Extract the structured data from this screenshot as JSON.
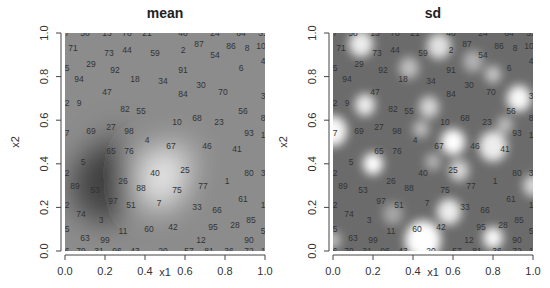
{
  "chart_data": [
    {
      "type": "heatmap",
      "title": "mean",
      "xlabel": "x1",
      "ylabel": "x2",
      "xlim": [
        0,
        1
      ],
      "ylim": [
        0,
        1
      ],
      "xticks": [
        "0.0",
        "0.2",
        "0.4",
        "0.6",
        "0.8",
        "1.0"
      ],
      "yticks": [
        "0.0",
        "0.2",
        "0.4",
        "0.6",
        "0.8",
        "1.0"
      ],
      "colormap": "grayscale",
      "base_value": 0.55,
      "features": [
        {
          "kind": "bright",
          "x": 0.47,
          "y": 0.33,
          "radius": 0.14,
          "strength": 0.45
        },
        {
          "kind": "bright",
          "x": 0.56,
          "y": 0.42,
          "radius": 0.1,
          "strength": 0.2
        },
        {
          "kind": "dark",
          "x": 0.2,
          "y": 0.3,
          "radius": 0.17,
          "strength": 0.32
        },
        {
          "kind": "dark",
          "x": 0.25,
          "y": 0.45,
          "radius": 0.12,
          "strength": 0.12
        }
      ],
      "points": [
        {
          "label": "7",
          "x": 0.01,
          "y": 1.0
        },
        {
          "label": "58",
          "x": 0.1,
          "y": 1.0
        },
        {
          "label": "13",
          "x": 0.21,
          "y": 1.0
        },
        {
          "label": "78",
          "x": 0.31,
          "y": 1.0
        },
        {
          "label": "21",
          "x": 0.41,
          "y": 1.0
        },
        {
          "label": "48",
          "x": 0.59,
          "y": 1.0
        },
        {
          "label": "24",
          "x": 0.75,
          "y": 1.0
        },
        {
          "label": "64",
          "x": 0.88,
          "y": 1.0
        },
        {
          "label": "31",
          "x": 0.99,
          "y": 1.0
        },
        {
          "label": "71",
          "x": 0.04,
          "y": 0.93
        },
        {
          "label": "73",
          "x": 0.22,
          "y": 0.91
        },
        {
          "label": "44",
          "x": 0.31,
          "y": 0.92
        },
        {
          "label": "59",
          "x": 0.45,
          "y": 0.91
        },
        {
          "label": "2",
          "x": 0.59,
          "y": 0.92
        },
        {
          "label": "87",
          "x": 0.67,
          "y": 0.95
        },
        {
          "label": "54",
          "x": 0.75,
          "y": 0.9
        },
        {
          "label": "86",
          "x": 0.83,
          "y": 0.94
        },
        {
          "label": "8",
          "x": 0.91,
          "y": 0.93
        },
        {
          "label": "10",
          "x": 0.98,
          "y": 0.94
        },
        {
          "label": "5",
          "x": 0.01,
          "y": 0.84
        },
        {
          "label": "29",
          "x": 0.13,
          "y": 0.86
        },
        {
          "label": "92",
          "x": 0.25,
          "y": 0.83
        },
        {
          "label": "18",
          "x": 0.35,
          "y": 0.79
        },
        {
          "label": "91",
          "x": 0.59,
          "y": 0.83
        },
        {
          "label": "6",
          "x": 0.88,
          "y": 0.84
        },
        {
          "label": "4",
          "x": 0.99,
          "y": 0.87
        },
        {
          "label": "94",
          "x": 0.07,
          "y": 0.79
        },
        {
          "label": "34",
          "x": 0.49,
          "y": 0.78
        },
        {
          "label": "30",
          "x": 0.68,
          "y": 0.76
        },
        {
          "label": "47",
          "x": 0.21,
          "y": 0.73
        },
        {
          "label": "84",
          "x": 0.59,
          "y": 0.72
        },
        {
          "label": "70",
          "x": 0.79,
          "y": 0.73
        },
        {
          "label": "3",
          "x": 0.99,
          "y": 0.71
        },
        {
          "label": "2",
          "x": 0.01,
          "y": 0.68
        },
        {
          "label": "9",
          "x": 0.07,
          "y": 0.68
        },
        {
          "label": "82",
          "x": 0.3,
          "y": 0.65
        },
        {
          "label": "55",
          "x": 0.38,
          "y": 0.64
        },
        {
          "label": "56",
          "x": 0.89,
          "y": 0.64
        },
        {
          "label": "8",
          "x": 0.99,
          "y": 0.61
        },
        {
          "label": "10",
          "x": 0.56,
          "y": 0.59
        },
        {
          "label": "68",
          "x": 0.66,
          "y": 0.61
        },
        {
          "label": "23",
          "x": 0.77,
          "y": 0.59
        },
        {
          "label": "7",
          "x": 0.01,
          "y": 0.54
        },
        {
          "label": "69",
          "x": 0.13,
          "y": 0.55
        },
        {
          "label": "27",
          "x": 0.23,
          "y": 0.57
        },
        {
          "label": "98",
          "x": 0.32,
          "y": 0.55
        },
        {
          "label": "4",
          "x": 0.41,
          "y": 0.51
        },
        {
          "label": "93",
          "x": 0.92,
          "y": 0.54
        },
        {
          "label": "1",
          "x": 0.99,
          "y": 0.53
        },
        {
          "label": "65",
          "x": 0.23,
          "y": 0.46
        },
        {
          "label": "76",
          "x": 0.32,
          "y": 0.46
        },
        {
          "label": "67",
          "x": 0.53,
          "y": 0.48
        },
        {
          "label": "46",
          "x": 0.71,
          "y": 0.48
        },
        {
          "label": "41",
          "x": 0.86,
          "y": 0.47
        },
        {
          "label": "5",
          "x": 0.09,
          "y": 0.41
        },
        {
          "label": "2",
          "x": 0.01,
          "y": 0.36
        },
        {
          "label": "40",
          "x": 0.45,
          "y": 0.36
        },
        {
          "label": "25",
          "x": 0.6,
          "y": 0.37
        },
        {
          "label": "80",
          "x": 0.92,
          "y": 0.36
        },
        {
          "label": "3",
          "x": 0.99,
          "y": 0.36
        },
        {
          "label": "89",
          "x": 0.05,
          "y": 0.3
        },
        {
          "label": "26",
          "x": 0.29,
          "y": 0.32
        },
        {
          "label": "88",
          "x": 0.38,
          "y": 0.29
        },
        {
          "label": "75",
          "x": 0.56,
          "y": 0.28
        },
        {
          "label": "77",
          "x": 0.69,
          "y": 0.3
        },
        {
          "label": "1",
          "x": 0.81,
          "y": 0.32
        },
        {
          "label": "53",
          "x": 0.15,
          "y": 0.28
        },
        {
          "label": "97",
          "x": 0.24,
          "y": 0.23
        },
        {
          "label": "51",
          "x": 0.33,
          "y": 0.21
        },
        {
          "label": "7",
          "x": 0.47,
          "y": 0.22
        },
        {
          "label": "61",
          "x": 0.89,
          "y": 0.24
        },
        {
          "label": "2",
          "x": 0.01,
          "y": 0.21
        },
        {
          "label": "33",
          "x": 0.66,
          "y": 0.2
        },
        {
          "label": "66",
          "x": 0.76,
          "y": 0.19
        },
        {
          "label": "1",
          "x": 0.99,
          "y": 0.21
        },
        {
          "label": "74",
          "x": 0.08,
          "y": 0.17
        },
        {
          "label": "3",
          "x": 0.18,
          "y": 0.14
        },
        {
          "label": "85",
          "x": 0.93,
          "y": 0.14
        },
        {
          "label": "5",
          "x": 0.01,
          "y": 0.1
        },
        {
          "label": "11",
          "x": 0.29,
          "y": 0.09
        },
        {
          "label": "60",
          "x": 0.42,
          "y": 0.1
        },
        {
          "label": "42",
          "x": 0.54,
          "y": 0.11
        },
        {
          "label": "95",
          "x": 0.74,
          "y": 0.11
        },
        {
          "label": "28",
          "x": 0.85,
          "y": 0.12
        },
        {
          "label": "5",
          "x": 0.99,
          "y": 0.09
        },
        {
          "label": "63",
          "x": 0.1,
          "y": 0.06
        },
        {
          "label": "99",
          "x": 0.2,
          "y": 0.05
        },
        {
          "label": "12",
          "x": 0.68,
          "y": 0.05
        },
        {
          "label": "90",
          "x": 0.92,
          "y": 0.05
        },
        {
          "label": "6",
          "x": 0.01,
          "y": 0.0
        },
        {
          "label": "79",
          "x": 0.08,
          "y": 0.0
        },
        {
          "label": "31",
          "x": 0.17,
          "y": 0.0
        },
        {
          "label": "96",
          "x": 0.26,
          "y": 0.0
        },
        {
          "label": "43",
          "x": 0.35,
          "y": 0.0
        },
        {
          "label": "20",
          "x": 0.49,
          "y": 0.0
        },
        {
          "label": "57",
          "x": 0.62,
          "y": 0.0
        },
        {
          "label": "81",
          "x": 0.72,
          "y": 0.0
        },
        {
          "label": "36",
          "x": 0.82,
          "y": 0.0
        },
        {
          "label": "72",
          "x": 0.92,
          "y": 0.0
        },
        {
          "label": "1",
          "x": 0.99,
          "y": 0.0
        }
      ]
    },
    {
      "type": "heatmap",
      "title": "sd",
      "xlabel": "x1",
      "ylabel": "x2",
      "xlim": [
        0,
        1
      ],
      "ylim": [
        0,
        1
      ],
      "xticks": [
        "0.0",
        "0.2",
        "0.4",
        "0.6",
        "0.8",
        "1.0"
      ],
      "yticks": [
        "0.0",
        "0.2",
        "0.4",
        "0.6",
        "0.8",
        "1.0"
      ],
      "colormap": "grayscale",
      "base_value": 0.42,
      "features": [
        {
          "kind": "bright",
          "x": 0.14,
          "y": 0.95,
          "radius": 0.06,
          "strength": 0.55
        },
        {
          "kind": "bright",
          "x": 0.53,
          "y": 0.94,
          "radius": 0.06,
          "strength": 0.5
        },
        {
          "kind": "bright",
          "x": 0.38,
          "y": 0.84,
          "radius": 0.05,
          "strength": 0.35
        },
        {
          "kind": "bright",
          "x": 0.7,
          "y": 0.87,
          "radius": 0.05,
          "strength": 0.3
        },
        {
          "kind": "bright",
          "x": 0.8,
          "y": 0.81,
          "radius": 0.04,
          "strength": 0.4
        },
        {
          "kind": "bright",
          "x": 0.93,
          "y": 0.7,
          "radius": 0.06,
          "strength": 0.6
        },
        {
          "kind": "bright",
          "x": 0.16,
          "y": 0.67,
          "radius": 0.05,
          "strength": 0.55
        },
        {
          "kind": "bright",
          "x": 0.48,
          "y": 0.66,
          "radius": 0.05,
          "strength": 0.45
        },
        {
          "kind": "bright",
          "x": 0.44,
          "y": 0.56,
          "radius": 0.04,
          "strength": 0.35
        },
        {
          "kind": "bright",
          "x": 0.6,
          "y": 0.5,
          "radius": 0.06,
          "strength": 0.7
        },
        {
          "kind": "bright",
          "x": 0.8,
          "y": 0.48,
          "radius": 0.07,
          "strength": 0.55
        },
        {
          "kind": "bright",
          "x": 0.86,
          "y": 0.58,
          "radius": 0.04,
          "strength": 0.35
        },
        {
          "kind": "bright",
          "x": 0.0,
          "y": 0.55,
          "radius": 0.07,
          "strength": 0.6
        },
        {
          "kind": "bright",
          "x": 0.2,
          "y": 0.4,
          "radius": 0.05,
          "strength": 0.65
        },
        {
          "kind": "bright",
          "x": 0.5,
          "y": 0.41,
          "radius": 0.04,
          "strength": 0.3
        },
        {
          "kind": "bright",
          "x": 0.63,
          "y": 0.37,
          "radius": 0.05,
          "strength": 0.45
        },
        {
          "kind": "bright",
          "x": 1.0,
          "y": 0.3,
          "radius": 0.05,
          "strength": 0.45
        },
        {
          "kind": "bright",
          "x": 0.58,
          "y": 0.18,
          "radius": 0.06,
          "strength": 0.55
        },
        {
          "kind": "bright",
          "x": 0.45,
          "y": 0.05,
          "radius": 0.09,
          "strength": 0.65
        },
        {
          "kind": "bright",
          "x": 0.8,
          "y": 0.06,
          "radius": 0.05,
          "strength": 0.6
        },
        {
          "kind": "bright",
          "x": 0.0,
          "y": 0.05,
          "radius": 0.04,
          "strength": 0.35
        },
        {
          "kind": "bright",
          "x": 0.3,
          "y": 0.17,
          "radius": 0.05,
          "strength": 0.25
        }
      ],
      "points_ref": "same as mean"
    }
  ]
}
